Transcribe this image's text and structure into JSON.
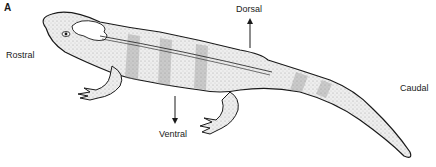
{
  "figure": {
    "panel_letter": "A",
    "labels": {
      "rostral": "Rostral",
      "dorsal": "Dorsal",
      "ventral": "Ventral",
      "caudal": "Caudal"
    },
    "colors": {
      "line": "#1a1a1a",
      "fill": "#ececec",
      "band": "#d6d6d6",
      "background": "#ffffff"
    }
  }
}
